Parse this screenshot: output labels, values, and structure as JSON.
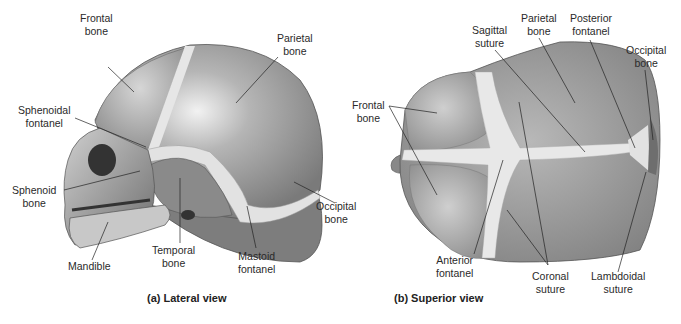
{
  "figure": {
    "background": "#ffffff",
    "bone_color": "#8f8f8f",
    "fontanel_color": "#e4e4e4",
    "leader_line_color": "#222222"
  },
  "lateral": {
    "caption": "(a) Lateral view",
    "labels": {
      "frontal_bone": [
        "Frontal",
        "bone"
      ],
      "parietal_bone": [
        "Parietal",
        "bone"
      ],
      "sphenoidal_fontanel": [
        "Sphenoidal",
        "fontanel"
      ],
      "sphenoid_bone": [
        "Sphenoid",
        "bone"
      ],
      "mandible": [
        "Mandible"
      ],
      "temporal_bone": [
        "Temporal",
        "bone"
      ],
      "mastoid_fontanel": [
        "Mastoid",
        "fontanel"
      ],
      "occipital_bone": [
        "Occipital",
        "bone"
      ]
    }
  },
  "superior": {
    "caption": "(b) Superior view",
    "labels": {
      "frontal_bone": [
        "Frontal",
        "bone"
      ],
      "sagittal_suture": [
        "Sagittal",
        "suture"
      ],
      "parietal_bone": [
        "Parietal",
        "bone"
      ],
      "posterior_fontanel": [
        "Posterior",
        "fontanel"
      ],
      "occipital_bone": [
        "Occipital",
        "bone"
      ],
      "anterior_fontanel": [
        "Anterior",
        "fontanel"
      ],
      "coronal_suture": [
        "Coronal",
        "suture"
      ],
      "lambdoidal_suture": [
        "Lambdoidal",
        "suture"
      ]
    }
  }
}
